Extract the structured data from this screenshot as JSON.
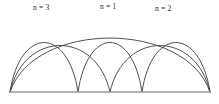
{
  "figure": {
    "type": "harmonic-arch-diagram",
    "background_color": "#ffffff",
    "curve_color": "#3c3c3c",
    "baseline_color": "#9a9a9a",
    "label_color": "#2b2b2b"
  },
  "labels": [
    {
      "id": "n3",
      "text": "n = 3",
      "x": 33,
      "y": 4
    },
    {
      "id": "n1",
      "text": "n = 1",
      "x": 100,
      "y": 3
    },
    {
      "id": "n2",
      "text": "n = 2",
      "x": 155,
      "y": 5
    }
  ],
  "chart_data": {
    "type": "line",
    "title": "",
    "xlabel": "",
    "ylabel": "",
    "grid": false,
    "legend": "inline-annotations",
    "xlim": [
      10,
      210
    ],
    "ylim": [
      92,
      16
    ],
    "baseline": {
      "x_start": 10,
      "x_end": 210,
      "y": 92
    },
    "nodes_on_baseline": [
      10,
      78,
      110,
      142,
      210
    ],
    "series": [
      {
        "name": "n = 1",
        "mode": 1,
        "peaks": [
          {
            "x": 110,
            "y": 20
          }
        ],
        "path": "M 10 92 C 34 20, 186 20, 210 92"
      },
      {
        "name": "n = 2",
        "mode": 2,
        "peaks": [
          {
            "x": 60,
            "y": 28
          },
          {
            "x": 160,
            "y": 28
          }
        ],
        "path": "M 10 92 C 24 30, 96 30, 110 92 C 124 30, 196 30, 210 92"
      },
      {
        "name": "n = 3",
        "mode": 3,
        "peaks": [
          {
            "x": 44,
            "y": 24
          },
          {
            "x": 110,
            "y": 24
          },
          {
            "x": 176,
            "y": 24
          }
        ],
        "path": "M 10 92 C 20 26, 68 26, 78 92 C 88 26, 132 26, 142 92 C 152 26, 200 26, 210 92"
      }
    ]
  }
}
